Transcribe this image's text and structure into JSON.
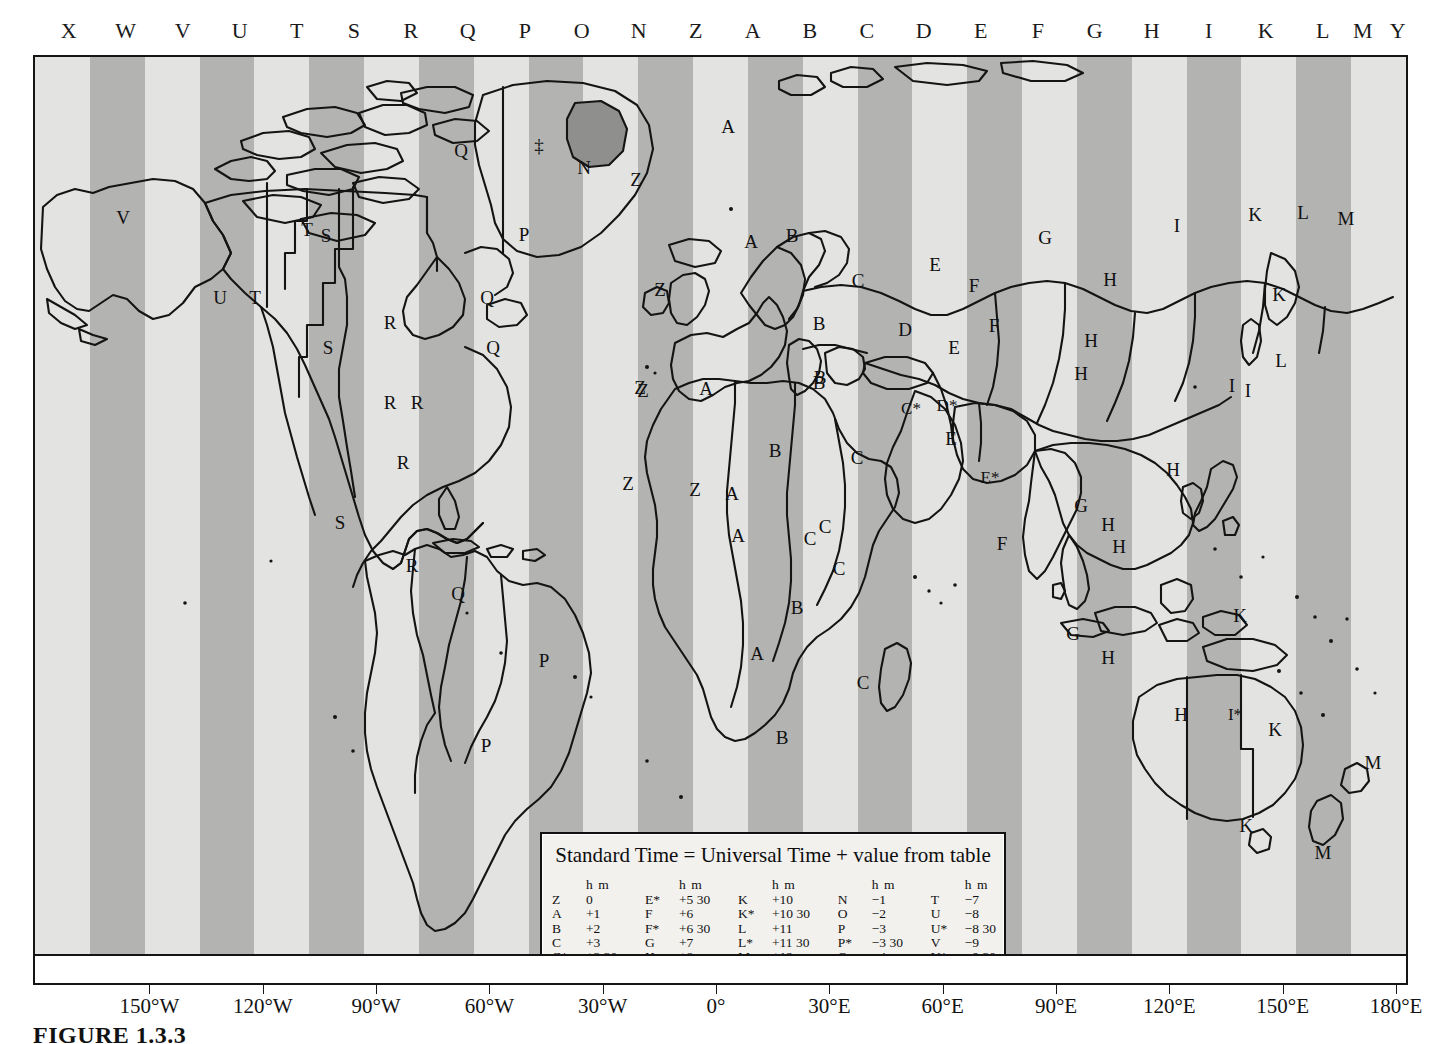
{
  "figure": {
    "caption": "FIGURE 1.3.3"
  },
  "zone_letter_strip": {
    "letters": [
      {
        "label": "X",
        "x": 36
      },
      {
        "label": "W",
        "x": 93
      },
      {
        "label": "V",
        "x": 150
      },
      {
        "label": "U",
        "x": 207
      },
      {
        "label": "T",
        "x": 264
      },
      {
        "label": "S",
        "x": 321
      },
      {
        "label": "R",
        "x": 378
      },
      {
        "label": "Q",
        "x": 435
      },
      {
        "label": "P",
        "x": 492
      },
      {
        "label": "O",
        "x": 549
      },
      {
        "label": "N",
        "x": 606
      },
      {
        "label": "Z",
        "x": 663
      },
      {
        "label": "A",
        "x": 720
      },
      {
        "label": "B",
        "x": 777
      },
      {
        "label": "C",
        "x": 834
      },
      {
        "label": "D",
        "x": 891
      },
      {
        "label": "E",
        "x": 948
      },
      {
        "label": "F",
        "x": 1005
      },
      {
        "label": "G",
        "x": 1062
      },
      {
        "label": "H",
        "x": 1119
      },
      {
        "label": "I",
        "x": 1176
      },
      {
        "label": "K",
        "x": 1233
      },
      {
        "label": "L",
        "x": 1290
      },
      {
        "label": "M",
        "x": 1330
      },
      {
        "label": "Y",
        "x": 1365
      }
    ]
  },
  "longitude_axis": {
    "ticks": [
      {
        "label": "150°W",
        "x": 211
      },
      {
        "label": "120°W",
        "x": 440
      },
      {
        "label": "90°W",
        "x": 669
      },
      {
        "label": "60°W",
        "x": 898
      },
      {
        "label": "30°W",
        "x": 1127
      },
      {
        "label": "0°",
        "x": 1356
      },
      {
        "label": "30°E",
        "x": 1585
      },
      {
        "label": "60°E",
        "x": 1814
      },
      {
        "label": "90°E",
        "x": 2043
      },
      {
        "label": "120°E",
        "x": 2272
      },
      {
        "label": "150°E",
        "x": 2501
      },
      {
        "label": "180°E",
        "x": 2730
      }
    ]
  },
  "legend": {
    "title": "Standard Time = Universal Time + value from table",
    "column_header": "h m",
    "footnote": "‡ No Standard Time legally adopted",
    "columns": [
      [
        {
          "k": "Z",
          "v": "0"
        },
        {
          "k": "A",
          "v": "+1"
        },
        {
          "k": "B",
          "v": "+2"
        },
        {
          "k": "C",
          "v": "+3"
        },
        {
          "k": "C*",
          "v": "+3 30"
        },
        {
          "k": "D",
          "v": "+4"
        },
        {
          "k": "D*",
          "v": "+4 30"
        },
        {
          "k": "E",
          "v": "+5"
        }
      ],
      [
        {
          "k": "E*",
          "v": "+5 30"
        },
        {
          "k": "F",
          "v": "+6"
        },
        {
          "k": "F*",
          "v": "+6 30"
        },
        {
          "k": "G",
          "v": "+7"
        },
        {
          "k": "H",
          "v": "+8"
        },
        {
          "k": "I",
          "v": "+9"
        },
        {
          "k": "I*",
          "v": "+9 30"
        }
      ],
      [
        {
          "k": "K",
          "v": "+10"
        },
        {
          "k": "K*",
          "v": "+10 30"
        },
        {
          "k": "L",
          "v": "+11"
        },
        {
          "k": "L*",
          "v": "+11 30"
        },
        {
          "k": "M",
          "v": "+12"
        },
        {
          "k": "M*",
          "v": "+13"
        },
        {
          "k": "M†",
          "v": "+14"
        }
      ],
      [
        {
          "k": "N",
          "v": "−1"
        },
        {
          "k": "O",
          "v": "−2"
        },
        {
          "k": "P",
          "v": "−3"
        },
        {
          "k": "P*",
          "v": "−3 30"
        },
        {
          "k": "Q",
          "v": "−4"
        },
        {
          "k": "R",
          "v": "−5"
        },
        {
          "k": "S",
          "v": "−6"
        }
      ],
      [
        {
          "k": "T",
          "v": "−7"
        },
        {
          "k": "U",
          "v": "−8"
        },
        {
          "k": "U*",
          "v": "−8 30"
        },
        {
          "k": "V",
          "v": "−9"
        },
        {
          "k": "V*",
          "v": "−9 30"
        },
        {
          "k": "W",
          "v": "−10"
        },
        {
          "k": "X",
          "v": "−11"
        },
        {
          "k": "Y",
          "v": "−12"
        }
      ]
    ]
  },
  "colors": {
    "stripe_light": "#e3e3e1",
    "stripe_dark": "#b3b3b1",
    "land_line": "#141414",
    "greenland_highlight": "#8f8f8d",
    "frame": "#141414"
  },
  "map_labels": [
    {
      "label": "V",
      "x": 88,
      "y": 160
    },
    {
      "label": "U",
      "x": 185,
      "y": 240
    },
    {
      "label": "T",
      "x": 220,
      "y": 240
    },
    {
      "label": "T",
      "x": 272,
      "y": 172
    },
    {
      "label": "S",
      "x": 291,
      "y": 178
    },
    {
      "label": "S",
      "x": 293,
      "y": 290
    },
    {
      "label": "R",
      "x": 355,
      "y": 265
    },
    {
      "label": "Q",
      "x": 452,
      "y": 240
    },
    {
      "label": "Q",
      "x": 426,
      "y": 93
    },
    {
      "label": "Q",
      "x": 458,
      "y": 290
    },
    {
      "label": "R",
      "x": 355,
      "y": 345
    },
    {
      "label": "R",
      "x": 382,
      "y": 345
    },
    {
      "label": "‡",
      "x": 504,
      "y": 88
    },
    {
      "label": "N",
      "x": 549,
      "y": 110
    },
    {
      "label": "P",
      "x": 489,
      "y": 177
    },
    {
      "label": "R",
      "x": 368,
      "y": 405
    },
    {
      "label": "S",
      "x": 305,
      "y": 465
    },
    {
      "label": "R",
      "x": 377,
      "y": 508
    },
    {
      "label": "Q",
      "x": 423,
      "y": 536
    },
    {
      "label": "P",
      "x": 509,
      "y": 603
    },
    {
      "label": "P",
      "x": 451,
      "y": 688
    },
    {
      "label": "Z",
      "x": 601,
      "y": 122
    },
    {
      "label": "Z",
      "x": 625,
      "y": 232
    },
    {
      "label": "Z",
      "x": 608,
      "y": 333
    },
    {
      "label": "Z",
      "x": 605,
      "y": 330
    },
    {
      "label": "Z",
      "x": 593,
      "y": 426
    },
    {
      "label": "A",
      "x": 693,
      "y": 69
    },
    {
      "label": "A",
      "x": 716,
      "y": 184
    },
    {
      "label": "B",
      "x": 757,
      "y": 178
    },
    {
      "label": "A",
      "x": 671,
      "y": 331
    },
    {
      "label": "B",
      "x": 784,
      "y": 266
    },
    {
      "label": "C",
      "x": 823,
      "y": 223
    },
    {
      "label": "E",
      "x": 900,
      "y": 207
    },
    {
      "label": "F",
      "x": 939,
      "y": 228
    },
    {
      "label": "F",
      "x": 959,
      "y": 268
    },
    {
      "label": "D",
      "x": 870,
      "y": 272
    },
    {
      "label": "E",
      "x": 919,
      "y": 290
    },
    {
      "label": "B",
      "x": 785,
      "y": 320
    },
    {
      "label": "B",
      "x": 784,
      "y": 325
    },
    {
      "label": "G",
      "x": 1010,
      "y": 180
    },
    {
      "label": "I",
      "x": 1142,
      "y": 168
    },
    {
      "label": "K",
      "x": 1220,
      "y": 157
    },
    {
      "label": "L",
      "x": 1268,
      "y": 155
    },
    {
      "label": "M",
      "x": 1311,
      "y": 161
    },
    {
      "label": "H",
      "x": 1075,
      "y": 222
    },
    {
      "label": "H",
      "x": 1056,
      "y": 283
    },
    {
      "label": "K",
      "x": 1244,
      "y": 237
    },
    {
      "label": "L",
      "x": 1246,
      "y": 303
    },
    {
      "label": "I",
      "x": 1197,
      "y": 328
    },
    {
      "label": "I",
      "x": 1213,
      "y": 333
    },
    {
      "label": "H",
      "x": 1046,
      "y": 316
    },
    {
      "label": "C*",
      "x": 876,
      "y": 351
    },
    {
      "label": "D*",
      "x": 912,
      "y": 348
    },
    {
      "label": "E",
      "x": 916,
      "y": 381
    },
    {
      "label": "E*",
      "x": 955,
      "y": 420
    },
    {
      "label": "G",
      "x": 1046,
      "y": 448
    },
    {
      "label": "H",
      "x": 1138,
      "y": 412
    },
    {
      "label": "F",
      "x": 967,
      "y": 486
    },
    {
      "label": "H",
      "x": 1073,
      "y": 467
    },
    {
      "label": "H",
      "x": 1084,
      "y": 489
    },
    {
      "label": "G",
      "x": 1038,
      "y": 576
    },
    {
      "label": "H",
      "x": 1073,
      "y": 600
    },
    {
      "label": "K",
      "x": 1205,
      "y": 558
    },
    {
      "label": "H",
      "x": 1146,
      "y": 657
    },
    {
      "label": "I*",
      "x": 1200,
      "y": 657
    },
    {
      "label": "K",
      "x": 1240,
      "y": 672
    },
    {
      "label": "K",
      "x": 1211,
      "y": 768
    },
    {
      "label": "M",
      "x": 1338,
      "y": 705
    },
    {
      "label": "M",
      "x": 1288,
      "y": 795
    },
    {
      "label": "Z",
      "x": 660,
      "y": 432
    },
    {
      "label": "A",
      "x": 697,
      "y": 436
    },
    {
      "label": "B",
      "x": 740,
      "y": 393
    },
    {
      "label": "C",
      "x": 822,
      "y": 400
    },
    {
      "label": "C",
      "x": 775,
      "y": 481
    },
    {
      "label": "C",
      "x": 790,
      "y": 469
    },
    {
      "label": "A",
      "x": 703,
      "y": 478
    },
    {
      "label": "C",
      "x": 804,
      "y": 511
    },
    {
      "label": "B",
      "x": 762,
      "y": 550
    },
    {
      "label": "A",
      "x": 722,
      "y": 596
    },
    {
      "label": "C",
      "x": 828,
      "y": 625
    },
    {
      "label": "B",
      "x": 747,
      "y": 680
    }
  ]
}
